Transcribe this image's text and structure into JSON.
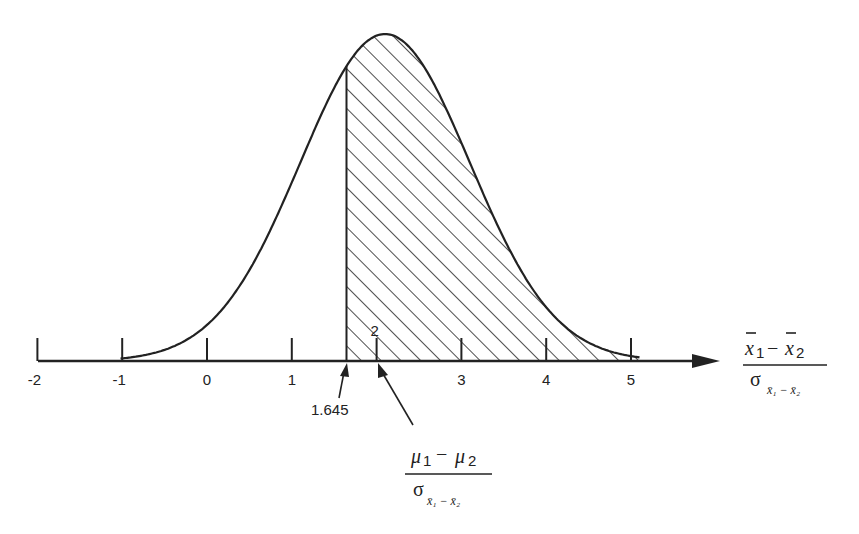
{
  "chart_data": {
    "type": "area",
    "title": "",
    "x_axis": {
      "ticks": [
        -2,
        -1,
        0,
        1,
        2,
        3,
        4,
        5
      ],
      "tick_labels": [
        "-2",
        "-1",
        "0",
        "1",
        "2",
        "3",
        "4",
        "5"
      ],
      "label_numerator": "x̄₁ − x̄₂",
      "label_denominator": "σ x̄₁ − x̄₂",
      "range": [
        -2,
        5.1
      ]
    },
    "curve": {
      "distribution": "normal",
      "mean": 2.1,
      "sd": 1.0
    },
    "shaded_region": {
      "from": 1.645,
      "to": 5.1,
      "pattern": "diagonal-hatch"
    },
    "annotations": [
      {
        "label": "1.645",
        "points_to": 1.645
      },
      {
        "label_numerator": "μ₁ − μ₂",
        "label_denominator": "σ x̄₁ − x̄₂",
        "points_to": 2.1
      }
    ],
    "grid": false,
    "legend": null
  },
  "labels": {
    "ticks": [
      "-2",
      "-1",
      "0",
      "1",
      "2",
      "3",
      "4",
      "5"
    ],
    "critical": "1.645",
    "axis_num_a": "x",
    "axis_num_sub1": "1",
    "axis_minus": "−",
    "axis_num_b": "x",
    "axis_num_sub2": "2",
    "axis_den_sigma": "σ",
    "axis_den_sub": "x̄₁ − x̄₂",
    "mu_num_a": "μ",
    "mu_sub1": "1",
    "mu_minus": "−",
    "mu_num_b": "μ",
    "mu_sub2": "2",
    "mu_den_sigma": "σ",
    "mu_den_sub": "x̄₁ − x̄₂"
  },
  "colors": {
    "ink": "#222222",
    "background": "#ffffff"
  }
}
